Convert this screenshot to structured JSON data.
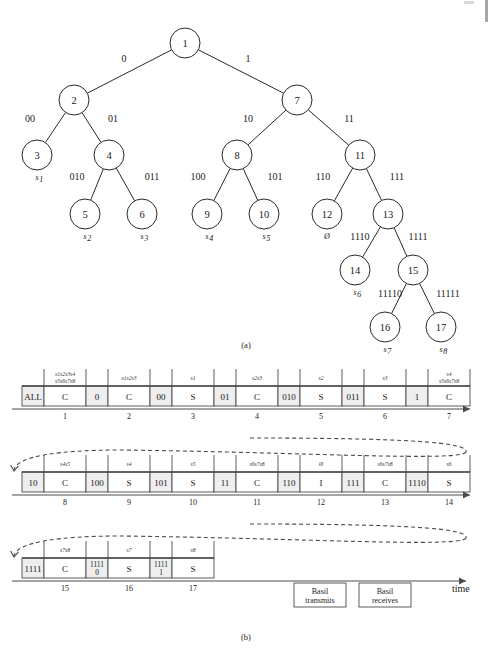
{
  "figure": {
    "panel_a_caption": "(a)",
    "panel_b_caption": "(b)",
    "time_axis_label": "time"
  },
  "tree": {
    "nodes": [
      {
        "id": "n1",
        "label": "1",
        "cx": 185,
        "cy": 43,
        "r": 15
      },
      {
        "id": "n2",
        "label": "2",
        "cx": 74,
        "cy": 100,
        "r": 15
      },
      {
        "id": "n7",
        "label": "7",
        "cx": 297,
        "cy": 100,
        "r": 15
      },
      {
        "id": "n3",
        "label": "3",
        "cx": 37,
        "cy": 155,
        "r": 15
      },
      {
        "id": "n4",
        "label": "4",
        "cx": 109,
        "cy": 155,
        "r": 15
      },
      {
        "id": "n8",
        "label": "8",
        "cx": 237,
        "cy": 155,
        "r": 15
      },
      {
        "id": "n11",
        "label": "11",
        "cx": 360,
        "cy": 155,
        "r": 15
      },
      {
        "id": "n5",
        "label": "5",
        "cx": 85,
        "cy": 214,
        "r": 15
      },
      {
        "id": "n6",
        "label": "6",
        "cx": 142,
        "cy": 214,
        "r": 15
      },
      {
        "id": "n9",
        "label": "9",
        "cx": 207,
        "cy": 214,
        "r": 15
      },
      {
        "id": "n10",
        "label": "10",
        "cx": 264,
        "cy": 214,
        "r": 15
      },
      {
        "id": "n12",
        "label": "12",
        "cx": 327,
        "cy": 214,
        "r": 15
      },
      {
        "id": "n13",
        "label": "13",
        "cx": 388,
        "cy": 214,
        "r": 15
      },
      {
        "id": "n14",
        "label": "14",
        "cx": 355,
        "cy": 270,
        "r": 15
      },
      {
        "id": "n15",
        "label": "15",
        "cx": 413,
        "cy": 270,
        "r": 15
      },
      {
        "id": "n16",
        "label": "16",
        "cx": 385,
        "cy": 327,
        "r": 15
      },
      {
        "id": "n17",
        "label": "17",
        "cx": 441,
        "cy": 327,
        "r": 15
      }
    ],
    "edge_labels": [
      {
        "text": "0",
        "x": 124,
        "y": 62
      },
      {
        "text": "1",
        "x": 248,
        "y": 62
      },
      {
        "text": "00",
        "x": 30,
        "y": 122
      },
      {
        "text": "01",
        "x": 113,
        "y": 122
      },
      {
        "text": "10",
        "x": 248,
        "y": 122
      },
      {
        "text": "11",
        "x": 349,
        "y": 122
      },
      {
        "text": "010",
        "x": 77,
        "y": 180
      },
      {
        "text": "011",
        "x": 152,
        "y": 180
      },
      {
        "text": "100",
        "x": 198,
        "y": 180
      },
      {
        "text": "101",
        "x": 275,
        "y": 180
      },
      {
        "text": "110",
        "x": 323,
        "y": 180
      },
      {
        "text": "111",
        "x": 397,
        "y": 180
      },
      {
        "text": "1110",
        "x": 360,
        "y": 240
      },
      {
        "text": "1111",
        "x": 418,
        "y": 240
      },
      {
        "text": "11110",
        "x": 390,
        "y": 297
      },
      {
        "text": "11111",
        "x": 448,
        "y": 297
      }
    ],
    "leaf_labels": [
      {
        "text": "s1",
        "sub": "1",
        "base": "s",
        "x": 37,
        "y": 180
      },
      {
        "text": "s2",
        "sub": "2",
        "base": "s",
        "x": 85,
        "y": 239
      },
      {
        "text": "s3",
        "sub": "3",
        "base": "s",
        "x": 142,
        "y": 239
      },
      {
        "text": "s4",
        "sub": "4",
        "base": "s",
        "x": 207,
        "y": 239
      },
      {
        "text": "s5",
        "sub": "5",
        "base": "s",
        "x": 264,
        "y": 239
      },
      {
        "text": "s6",
        "sub": "6",
        "base": "s",
        "x": 355,
        "y": 295
      },
      {
        "text": "s7",
        "sub": "7",
        "base": "s",
        "x": 385,
        "y": 352
      },
      {
        "text": "s8",
        "sub": "8",
        "base": "s",
        "x": 441,
        "y": 352
      },
      {
        "text": "0",
        "sub": "",
        "base": "Ø",
        "x": 327,
        "y": 239
      }
    ]
  },
  "timeline": {
    "rows": [
      {
        "row_index": 0,
        "y_top": 386,
        "cells": [
          {
            "label": "ALL",
            "shaded": true,
            "w": 22,
            "head": "",
            "slot": ""
          },
          {
            "label": "C",
            "shaded": false,
            "w": 42,
            "head": "s1s2s3s4 s5s6s7s8",
            "head_lines": [
              "s1s2s3s4",
              "s5s6s7s8"
            ],
            "slot": "1"
          },
          {
            "label": "0",
            "shaded": true,
            "w": 22,
            "head": "",
            "slot": ""
          },
          {
            "label": "C",
            "shaded": false,
            "w": 42,
            "head": "s1s2s3",
            "head_lines": [
              "s1s2s3"
            ],
            "slot": "2"
          },
          {
            "label": "00",
            "shaded": true,
            "w": 22,
            "head": "",
            "slot": ""
          },
          {
            "label": "S",
            "shaded": false,
            "w": 42,
            "head": "s1",
            "head_lines": [
              "s1"
            ],
            "slot": "3"
          },
          {
            "label": "01",
            "shaded": true,
            "w": 22,
            "head": "",
            "slot": ""
          },
          {
            "label": "C",
            "shaded": false,
            "w": 42,
            "head": "s2s3",
            "head_lines": [
              "s2s3"
            ],
            "slot": "4"
          },
          {
            "label": "010",
            "shaded": true,
            "w": 22,
            "head": "",
            "slot": ""
          },
          {
            "label": "S",
            "shaded": false,
            "w": 42,
            "head": "s2",
            "head_lines": [
              "s2"
            ],
            "slot": "5"
          },
          {
            "label": "011",
            "shaded": true,
            "w": 22,
            "head": "",
            "slot": ""
          },
          {
            "label": "S",
            "shaded": false,
            "w": 42,
            "head": "s3",
            "head_lines": [
              "s3"
            ],
            "slot": "6"
          },
          {
            "label": "1",
            "shaded": true,
            "w": 22,
            "head": "",
            "slot": ""
          },
          {
            "label": "C",
            "shaded": false,
            "w": 42,
            "head": "s4 s5s6s7s8",
            "head_lines": [
              "s4",
              "s5s6s7s8"
            ],
            "slot": "7"
          }
        ]
      },
      {
        "row_index": 1,
        "y_top": 472,
        "cells": [
          {
            "label": "10",
            "shaded": true,
            "w": 22,
            "head": "",
            "slot": ""
          },
          {
            "label": "C",
            "shaded": false,
            "w": 42,
            "head": "s4s5",
            "head_lines": [
              "s4s5"
            ],
            "slot": "8"
          },
          {
            "label": "100",
            "shaded": true,
            "w": 22,
            "head": "",
            "slot": ""
          },
          {
            "label": "S",
            "shaded": false,
            "w": 42,
            "head": "s4",
            "head_lines": [
              "s4"
            ],
            "slot": "9"
          },
          {
            "label": "101",
            "shaded": true,
            "w": 22,
            "head": "",
            "slot": ""
          },
          {
            "label": "S",
            "shaded": false,
            "w": 42,
            "head": "s5",
            "head_lines": [
              "s5"
            ],
            "slot": "10"
          },
          {
            "label": "11",
            "shaded": true,
            "w": 22,
            "head": "",
            "slot": ""
          },
          {
            "label": "C",
            "shaded": false,
            "w": 42,
            "head": "s6s7s8",
            "head_lines": [
              "s6s7s8"
            ],
            "slot": "11"
          },
          {
            "label": "110",
            "shaded": true,
            "w": 22,
            "head": "",
            "slot": ""
          },
          {
            "label": "I",
            "shaded": false,
            "w": 42,
            "head": "Ø",
            "head_lines": [
              "Ø"
            ],
            "slot": "12"
          },
          {
            "label": "111",
            "shaded": true,
            "w": 22,
            "head": "",
            "slot": ""
          },
          {
            "label": "C",
            "shaded": false,
            "w": 42,
            "head": "s6s7s8",
            "head_lines": [
              "s6s7s8"
            ],
            "slot": "13"
          },
          {
            "label": "1110",
            "shaded": true,
            "w": 22,
            "head": "",
            "slot": ""
          },
          {
            "label": "S",
            "shaded": false,
            "w": 42,
            "head": "s6",
            "head_lines": [
              "s6"
            ],
            "slot": "14"
          }
        ]
      },
      {
        "row_index": 2,
        "y_top": 558,
        "cells": [
          {
            "label": "1111",
            "shaded": true,
            "w": 22,
            "head": "",
            "slot": ""
          },
          {
            "label": "C",
            "shaded": false,
            "w": 42,
            "head": "s7s8",
            "head_lines": [
              "s7s8"
            ],
            "slot": "15"
          },
          {
            "label": "11110",
            "shaded": true,
            "w": 22,
            "head": "",
            "slot": ""
          },
          {
            "label": "S",
            "shaded": false,
            "w": 42,
            "head": "s7",
            "head_lines": [
              "s7"
            ],
            "slot": "16"
          },
          {
            "label": "11111",
            "shaded": true,
            "w": 22,
            "head": "",
            "slot": ""
          },
          {
            "label": "S",
            "shaded": false,
            "w": 42,
            "head": "s8",
            "head_lines": [
              "s8"
            ],
            "slot": "17"
          }
        ]
      }
    ]
  },
  "legend": {
    "items": [
      {
        "line1": "Basil",
        "line2": "transmits",
        "x": 320,
        "y": 583
      },
      {
        "line1": "Basil",
        "line2": "receives",
        "x": 385,
        "y": 583
      }
    ]
  },
  "colors": {
    "ink": "#1a1a1a",
    "rule": "#4a4a4a",
    "shade": "#eeeeee",
    "paper": "#ffffff"
  }
}
